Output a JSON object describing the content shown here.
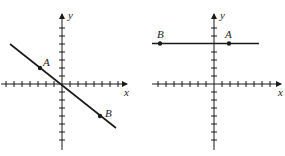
{
  "colors": {
    "ink": "#1a1a1a",
    "background": "#ffffff"
  },
  "graphs": [
    {
      "id": "left",
      "x_label": "x",
      "y_label": "y",
      "line": "descending line through origin",
      "points": [
        {
          "label": "A"
        },
        {
          "label": "B"
        }
      ]
    },
    {
      "id": "right",
      "x_label": "x",
      "y_label": "y",
      "line": "horizontal line above x-axis",
      "points": [
        {
          "label": "B"
        },
        {
          "label": "A"
        }
      ]
    }
  ]
}
